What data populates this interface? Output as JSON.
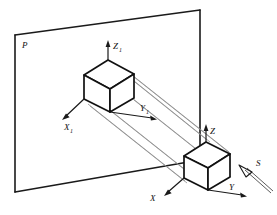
{
  "figure": {
    "type": "technical-geometry-diagram",
    "background_color": "#ffffff",
    "line_color": "#111111",
    "ray_color": "#8d8d8d"
  },
  "labels": {
    "plane": "P",
    "projected_axis_z": "Z",
    "projected_axis_z_sub": "1",
    "projected_axis_y": "Y",
    "projected_axis_y_sub": "1",
    "projected_axis_x": "X",
    "projected_axis_x_sub": "1",
    "object_axis_z": "Z",
    "object_axis_y": "Y",
    "object_axis_x": "X",
    "projection_direction": "S"
  },
  "objects": [
    {
      "name": "projection-plane",
      "label": "P",
      "shape": "quadrilateral",
      "corners": [
        [
          15,
          35
        ],
        [
          200,
          10
        ],
        [
          200,
          160
        ],
        [
          15,
          192
        ]
      ]
    },
    {
      "name": "projected-cube",
      "description": "image of the cube on plane P",
      "origin": [
        108,
        118
      ]
    },
    {
      "name": "object-cube",
      "description": "original cube in space",
      "origin": [
        206,
        155
      ]
    }
  ],
  "ray_count": 4
}
